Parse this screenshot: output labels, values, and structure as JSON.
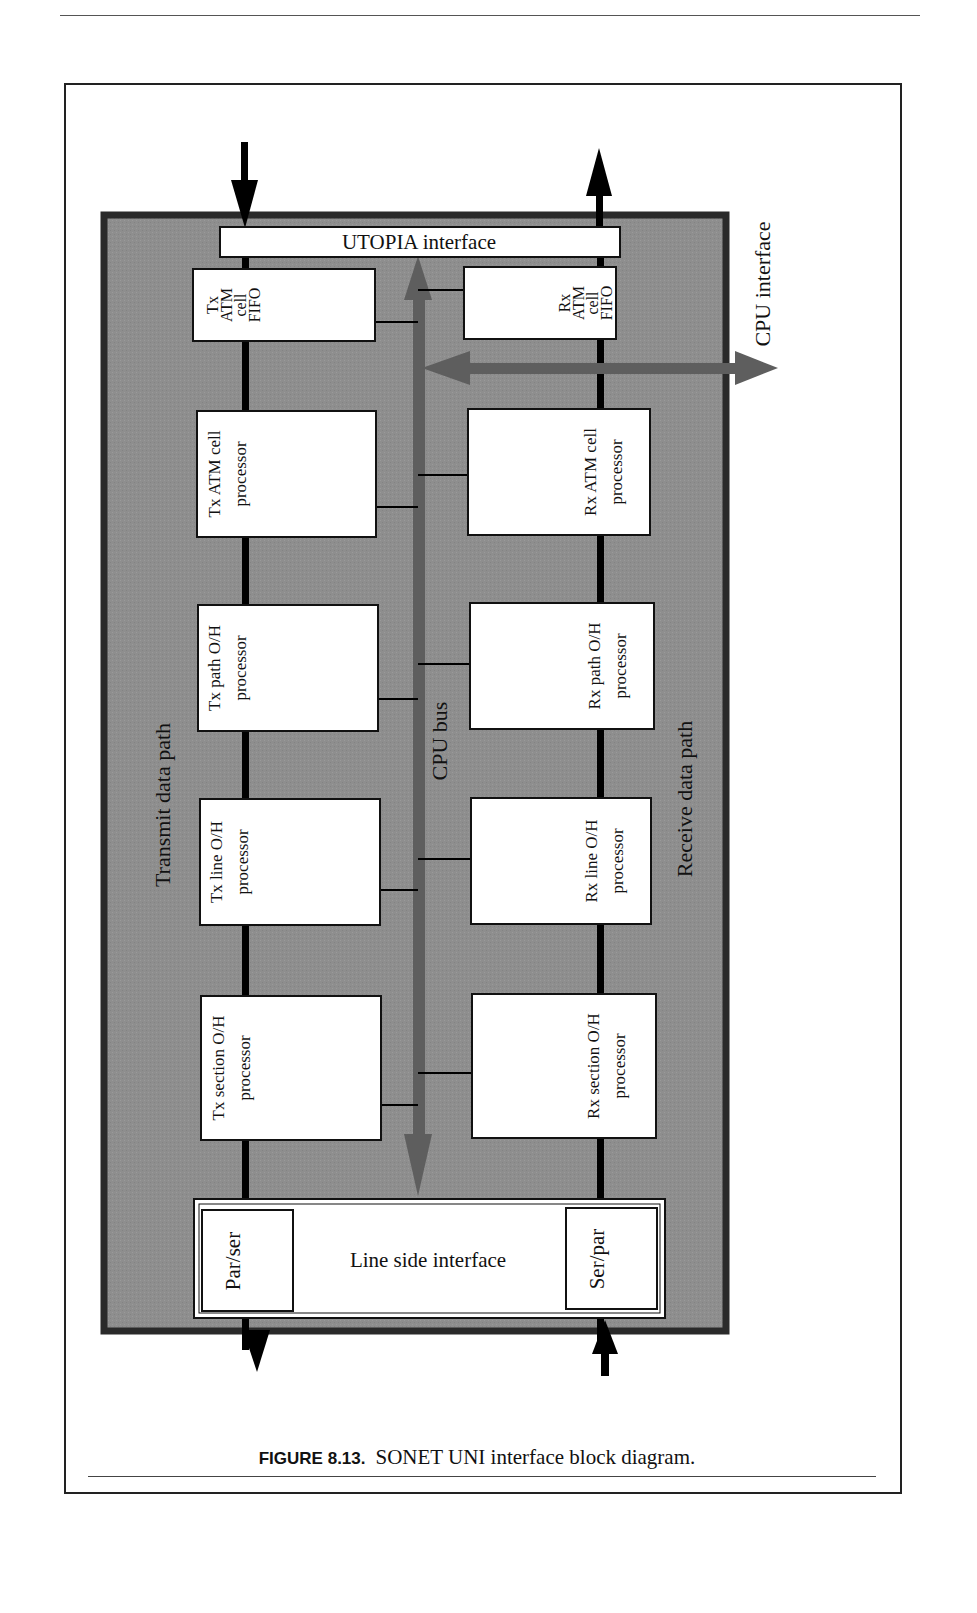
{
  "figure": {
    "label": "FIGURE 8.13.",
    "caption": "SONET UNI interface block diagram."
  },
  "diagram": {
    "utopia": "UTOPIA interface",
    "cpu_interface": "CPU interface",
    "cpu_bus": "CPU bus",
    "transmit_path": "Transmit data path",
    "receive_path": "Receive data path",
    "line_side": "Line side interface",
    "par_ser": "Par/ser",
    "ser_par": "Ser/par",
    "tx_blocks": [
      {
        "line1": "Tx",
        "line2": "ATM",
        "line3": "cell",
        "line4": "FIFO"
      },
      {
        "line1": "Tx ATM cell",
        "line2": "processor"
      },
      {
        "line1": "Tx path O/H",
        "line2": "processor"
      },
      {
        "line1": "Tx line O/H",
        "line2": "processor"
      },
      {
        "line1": "Tx section O/H",
        "line2": "processor"
      }
    ],
    "rx_blocks": [
      {
        "line1": "Rx",
        "line2": "ATM",
        "line3": "cell",
        "line4": "FIFO"
      },
      {
        "line1": "Rx ATM cell",
        "line2": "processor"
      },
      {
        "line1": "Rx path O/H",
        "line2": "processor"
      },
      {
        "line1": "Rx line O/H",
        "line2": "processor"
      },
      {
        "line1": "Rx section O/H",
        "line2": "processor"
      }
    ]
  },
  "colors": {
    "panel_fill": "#8c8c8c",
    "panel_border": "#2a2a2a",
    "bus_arrow": "#5e5e5e",
    "block_fill": "#ffffff",
    "line": "#000000"
  }
}
